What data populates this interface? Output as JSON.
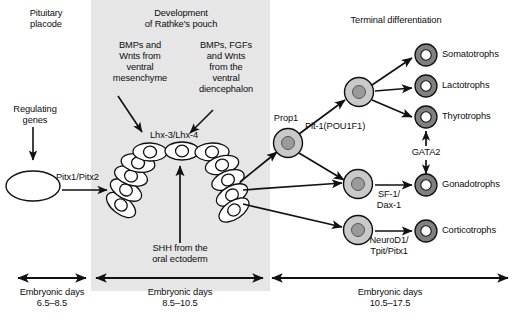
{
  "figure": {
    "title_top_left": "Pituitary\nplacode",
    "title_top_mid": "Development\nof Rathke's pouch",
    "title_top_right": "Terminal differentiation",
    "background_band_color": "#e6e6e6",
    "stroke_color": "#111111",
    "progenitor_cell_fill": "#c9c9c9",
    "progenitor_nucleus_fill": "#9a9a9a",
    "terminal_cell_fill": "#808080",
    "terminal_nucleus_fill": "#ffffff",
    "pouch_cell_fill": "#ffffff"
  },
  "labels": {
    "regulating_genes": "Regulating\ngenes",
    "pitx1_pitx2": "Pitx1/Pitx2",
    "bmps_wnts_ventral_mesenchyme": "BMPs and\nWnts from\nventral\nmesenchyme",
    "bmps_fgfs_wnts_diencephalon": "BMPs, FGFs\nand Wnts\nfrom the\nventral\ndiencephalon",
    "lhx3_lhx4": "Lhx-3/Lhx-4",
    "shh_oral_ectoderm": "SHH from the\noral ectoderm",
    "prop1": "Prop1",
    "pit1_pou1f1": "Pit-1(POU1F1)",
    "gata2": "GATA2",
    "sf1_dax1": "SF-1/\nDax-1",
    "neurod1_tpit_pitx1": "NeuroD1/\nTpit/Pitx1"
  },
  "cell_types": [
    {
      "id": "somatotrophs",
      "label": "Somatotrophs"
    },
    {
      "id": "lactotrophs",
      "label": "Lactotrophs"
    },
    {
      "id": "thyrotrophs",
      "label": "Thyrotrophs"
    },
    {
      "id": "gonadotrophs",
      "label": "Gonadotrophs"
    },
    {
      "id": "corticotrophs",
      "label": "Corticotrophs"
    }
  ],
  "timeline": [
    {
      "id": "stage-1",
      "label": "Embryonic days\n6.5–8.5"
    },
    {
      "id": "stage-2",
      "label": "Embryonic days\n8.5–10.5"
    },
    {
      "id": "stage-3",
      "label": "Embryonic days\n10.5–17.5"
    }
  ]
}
